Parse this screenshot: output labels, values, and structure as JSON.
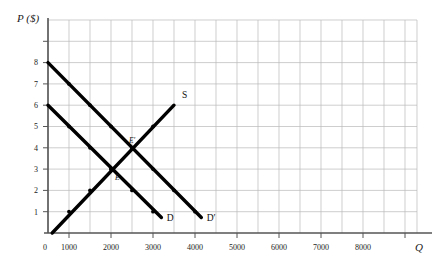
{
  "chart_data": {
    "type": "line",
    "title": "",
    "xlabel": "Q",
    "ylabel": "P ($)",
    "xlim": [
      0,
      8800
    ],
    "ylim": [
      0,
      10.5
    ],
    "grid": true,
    "grid_color": "#b9b9b9",
    "curve_color": "#000000",
    "axis_color": "#555555",
    "background": "#ffffff",
    "legend_position": "inline-labels",
    "x_ticks": [
      {
        "value": 0,
        "label": "0"
      },
      {
        "value": 1000,
        "label": "1000"
      },
      {
        "value": 2000,
        "label": "2000"
      },
      {
        "value": 3000,
        "label": "3000"
      },
      {
        "value": 4000,
        "label": "4000"
      },
      {
        "value": 5000,
        "label": "5000"
      },
      {
        "value": 6000,
        "label": "6000"
      },
      {
        "value": 7000,
        "label": "7000"
      },
      {
        "value": 8000,
        "label": "8000"
      }
    ],
    "y_ticks": [
      {
        "value": 1,
        "label": "1"
      },
      {
        "value": 2,
        "label": "2"
      },
      {
        "value": 3,
        "label": "3"
      },
      {
        "value": 4,
        "label": "4"
      },
      {
        "value": 5,
        "label": "5"
      },
      {
        "value": 6,
        "label": "6"
      },
      {
        "value": 7,
        "label": "7"
      },
      {
        "value": 8,
        "label": "8"
      }
    ],
    "series": [
      {
        "name": "S",
        "label": "S",
        "kind": "supply",
        "points": [
          [
            200,
            0
          ],
          [
            6000,
            6
          ]
        ],
        "markers": [
          [
            1000,
            1
          ],
          [
            2000,
            2
          ],
          [
            3000,
            3
          ],
          [
            4000,
            4
          ],
          [
            5000,
            5
          ]
        ],
        "label_x": 6380,
        "label_y": 6.35
      },
      {
        "name": "D",
        "label": "D",
        "kind": "demand-original",
        "points": [
          [
            0,
            6
          ],
          [
            5400,
            0.73
          ]
        ],
        "markers": [
          [
            1000,
            5
          ],
          [
            2000,
            4
          ],
          [
            3000,
            3
          ],
          [
            4000,
            2
          ],
          [
            5000,
            1
          ]
        ],
        "label_x": 5650,
        "label_y": 0.55
      },
      {
        "name": "D'",
        "label": "D′",
        "kind": "demand-shifted",
        "points": [
          [
            0,
            8
          ],
          [
            7300,
            0.73
          ]
        ],
        "markers": [
          [
            1000,
            7
          ],
          [
            2000,
            6
          ],
          [
            3000,
            5
          ],
          [
            4000,
            4
          ],
          [
            5000,
            3
          ],
          [
            6000,
            2
          ],
          [
            7000,
            1
          ]
        ],
        "label_x": 7560,
        "label_y": 0.55
      }
    ],
    "annotations": [
      {
        "name": "E",
        "label": "E",
        "x": 3000,
        "y": 3,
        "dx": 4,
        "dy": 11,
        "note": "original equilibrium"
      },
      {
        "name": "E-prime",
        "label": "E′",
        "x": 4000,
        "y": 4,
        "dx": -3,
        "dy": -5,
        "note": "new equilibrium"
      }
    ]
  },
  "axes": {
    "y_axis_title": "P ($)",
    "x_axis_title": "Q",
    "origin_label": "0"
  }
}
